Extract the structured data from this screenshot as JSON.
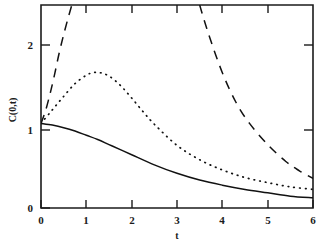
{
  "chart_data": {
    "type": "line",
    "title": "",
    "xlabel": "t",
    "ylabel": "C(0,t)",
    "xlim": [
      0,
      6
    ],
    "ylim": [
      0,
      2.4
    ],
    "grid": false,
    "legend": "none",
    "xticks": [
      0,
      1,
      2,
      3,
      4,
      5,
      6
    ],
    "xticklabels": [
      "0",
      "1",
      "2",
      "3",
      "4",
      "5",
      "6"
    ],
    "yticks": [
      0,
      1,
      2
    ],
    "yticklabels": [
      "0",
      "1",
      "2"
    ],
    "series": [
      {
        "name": "solid",
        "style": "solid",
        "x": [
          0,
          0.25,
          0.5,
          0.75,
          1,
          1.25,
          1.5,
          1.75,
          2,
          2.5,
          3,
          3.5,
          4,
          4.5,
          5,
          5.5,
          6
        ],
        "values": [
          1.0,
          0.98,
          0.95,
          0.91,
          0.86,
          0.81,
          0.75,
          0.69,
          0.63,
          0.51,
          0.41,
          0.33,
          0.27,
          0.22,
          0.18,
          0.14,
          0.12
        ]
      },
      {
        "name": "dotted",
        "style": "dotted",
        "x": [
          0,
          0.25,
          0.5,
          0.75,
          1,
          1.15,
          1.3,
          1.5,
          1.75,
          2,
          2.25,
          2.5,
          3,
          3.5,
          4,
          4.5,
          5,
          5.5,
          6
        ],
        "values": [
          1.0,
          1.16,
          1.32,
          1.47,
          1.57,
          1.6,
          1.6,
          1.56,
          1.45,
          1.3,
          1.14,
          0.99,
          0.74,
          0.57,
          0.45,
          0.36,
          0.3,
          0.25,
          0.22
        ]
      },
      {
        "name": "dashed-left-branch",
        "style": "dashed",
        "x": [
          0,
          0.1,
          0.2,
          0.3,
          0.4,
          0.5,
          0.6,
          0.68
        ],
        "values": [
          1.0,
          1.15,
          1.35,
          1.58,
          1.83,
          2.05,
          2.25,
          2.4
        ]
      },
      {
        "name": "dashed-right-branch",
        "style": "dashed",
        "x": [
          3.5,
          3.7,
          4.0,
          4.3,
          4.6,
          5.0,
          5.4,
          5.7,
          6.0
        ],
        "values": [
          2.4,
          2.05,
          1.6,
          1.25,
          1.0,
          0.75,
          0.55,
          0.44,
          0.35
        ]
      }
    ]
  },
  "axes": {
    "y_label": "C(0,t)",
    "x_label": "t",
    "y_tick_0": "0",
    "y_tick_1": "1",
    "y_tick_2": "2",
    "x_tick_0": "0",
    "x_tick_1": "1",
    "x_tick_2": "2",
    "x_tick_3": "3",
    "x_tick_4": "4",
    "x_tick_5": "5",
    "x_tick_6": "6"
  }
}
